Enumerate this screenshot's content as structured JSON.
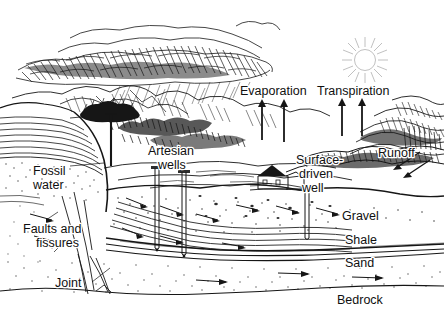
{
  "figure": {
    "style": "pen-and-ink line drawing",
    "ink_color": "#161616",
    "background_color": "#ffffff",
    "sun_color": "#b9b9b9"
  },
  "labels": {
    "evaporation": "Evaporation",
    "transpiration": "Transpiration",
    "runoff": "Runoff",
    "artesian_wells_line1": "Artesian",
    "artesian_wells_line2": "wells",
    "surface_driven_well_line1": "Surface-",
    "surface_driven_well_line2": "driven",
    "surface_driven_well_line3": "well",
    "fossil_water_line1": "Fossil",
    "fossil_water_line2": "water",
    "faults_line1": "Faults and",
    "faults_line2": "fissures",
    "joint": "Joint",
    "gravel": "Gravel",
    "shale": "Shale",
    "sand": "Sand",
    "bedrock": "Bedrock"
  },
  "icons": {
    "sun": "sun-icon",
    "cloud": "rain-cloud-icon",
    "house": "house-icon",
    "well_shaft": "well-shaft-icon",
    "up_arrow": "up-arrow-icon",
    "flow_arrow": "flow-arrow-icon"
  },
  "features": {
    "arrows_evaporation_count": 2,
    "arrows_transpiration_count": 2,
    "artesian_well_count": 2,
    "surface_driven_well_count": 1
  }
}
